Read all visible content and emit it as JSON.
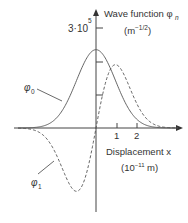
{
  "chart_data": {
    "type": "line",
    "title": "",
    "xlabel": "Displacement x",
    "xunit": "(10⁻¹¹ m)",
    "ylabel": "Wave function φn",
    "yunit": "(m⁻¹ᐟ²)",
    "x_ticks": [
      "1",
      "2"
    ],
    "y_tick_label": "3·10",
    "y_tick_label_exp": "5",
    "y_ticks_values": [
      100000,
      200000,
      300000
    ],
    "xlim": [
      -4,
      4.2
    ],
    "ylim": [
      -250000.0,
      350000.0
    ],
    "grid": false,
    "legend_position": "inline labels",
    "series": [
      {
        "name": "φ0",
        "label_base": "φ",
        "label_sub": "0",
        "style": "solid",
        "x": [
          -3,
          -2.5,
          -2,
          -1.5,
          -1,
          -0.5,
          0,
          0.5,
          1,
          1.5,
          2,
          2.5,
          3
        ],
        "values": [
          1600,
          7600,
          25000,
          67000,
          140000,
          206000,
          235000,
          206000,
          140000,
          67000,
          25000,
          7600,
          1600
        ]
      },
      {
        "name": "φ1",
        "label_base": "φ",
        "label_sub": "1",
        "style": "dashed",
        "x": [
          -3,
          -2.5,
          -2,
          -1.5,
          -1,
          -0.5,
          0,
          0.5,
          1,
          1.5,
          2,
          2.5,
          3
        ],
        "values": [
          -16000,
          -60000,
          -140000,
          -195000,
          -200000,
          -120000,
          0,
          120000,
          200000,
          195000,
          140000,
          60000,
          16000
        ]
      }
    ]
  },
  "labels": {
    "y_axis_title": "Wave function φ",
    "y_axis_title_sub": "n",
    "y_axis_unit_base": "(m",
    "y_axis_unit_exp": "−1/2",
    "y_axis_unit_end": ")",
    "y_tick_base": "3·10",
    "y_tick_exp": "5",
    "x_axis_title": "Displacement x",
    "x_axis_unit_base": "(10",
    "x_axis_unit_exp": "−11",
    "x_axis_unit_end": " m)",
    "x_tick_1": "1",
    "x_tick_2": "2",
    "phi0_base": "φ",
    "phi0_sub": "0",
    "phi1_base": "φ",
    "phi1_sub": "1"
  },
  "colors": {
    "line": "#555555",
    "axis": "#444444",
    "text": "#333333"
  }
}
